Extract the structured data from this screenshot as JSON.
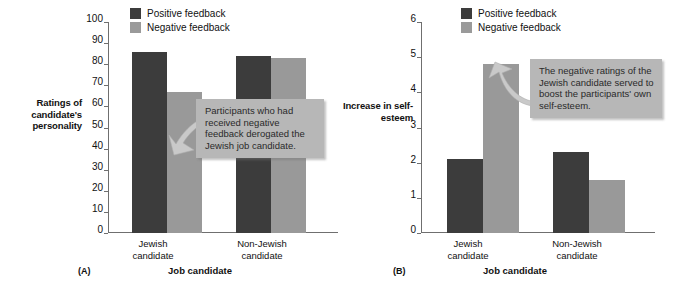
{
  "figure": {
    "background": "#ffffff",
    "colors": {
      "positive": "#3c3c3c",
      "negative": "#999999",
      "callout_bg": "#b7b7b7",
      "axis": "#6f6f6f",
      "text": "#111111"
    }
  },
  "legend": {
    "positive_label": "Positive feedback",
    "negative_label": "Negative feedback"
  },
  "panels": {
    "a": {
      "letter": "(A)",
      "ytitle": "Ratings of candidate's personality",
      "xtitle": "Job candidate",
      "ticks": [
        "0",
        "10",
        "20",
        "30",
        "40",
        "50",
        "60",
        "70",
        "80",
        "90",
        "100"
      ],
      "group_labels": [
        "Jewish\ncandidate",
        "Non-Jewish\ncandidate"
      ],
      "callout": "Participants who had received negative feedback derogated the Jewish job candidate."
    },
    "b": {
      "letter": "(B)",
      "ytitle": "Increase in self-esteem",
      "xtitle": "Job candidate",
      "ticks": [
        "0",
        "1",
        "2",
        "3",
        "4",
        "5",
        "6"
      ],
      "group_labels": [
        "Jewish\ncandidate",
        "Non-Jewish\ncandidate"
      ],
      "callout": "The negative ratings of the Jewish candidate served to boost the participants' own self-esteem."
    }
  },
  "chart_data": [
    {
      "type": "bar",
      "panel": "(A)",
      "title": "",
      "xlabel": "Job candidate",
      "ylabel": "Ratings of candidate's personality",
      "categories": [
        "Jewish candidate",
        "Non-Jewish candidate"
      ],
      "series": [
        {
          "name": "Positive feedback",
          "color": "#3c3c3c",
          "values": [
            86,
            84
          ]
        },
        {
          "name": "Negative feedback",
          "color": "#999999",
          "values": [
            67,
            83
          ]
        }
      ],
      "ylim": [
        0,
        100
      ],
      "ytick_step": 10,
      "yticks": [
        0,
        10,
        20,
        30,
        40,
        50,
        60,
        70,
        80,
        90,
        100
      ],
      "grid": false,
      "legend_position": "top-center",
      "annotations": [
        "Participants who had received negative feedback derogated the Jewish job candidate."
      ]
    },
    {
      "type": "bar",
      "panel": "(B)",
      "title": "",
      "xlabel": "Job candidate",
      "ylabel": "Increase in self-esteem",
      "categories": [
        "Jewish candidate",
        "Non-Jewish candidate"
      ],
      "series": [
        {
          "name": "Positive feedback",
          "color": "#3c3c3c",
          "values": [
            2.1,
            2.3
          ]
        },
        {
          "name": "Negative feedback",
          "color": "#999999",
          "values": [
            4.8,
            1.5
          ]
        }
      ],
      "ylim": [
        0,
        6
      ],
      "ytick_step": 1,
      "yticks": [
        0,
        1,
        2,
        3,
        4,
        5,
        6
      ],
      "grid": false,
      "legend_position": "top-center",
      "annotations": [
        "The negative ratings of the Jewish candidate served to boost the participants' own self-esteem."
      ]
    }
  ]
}
